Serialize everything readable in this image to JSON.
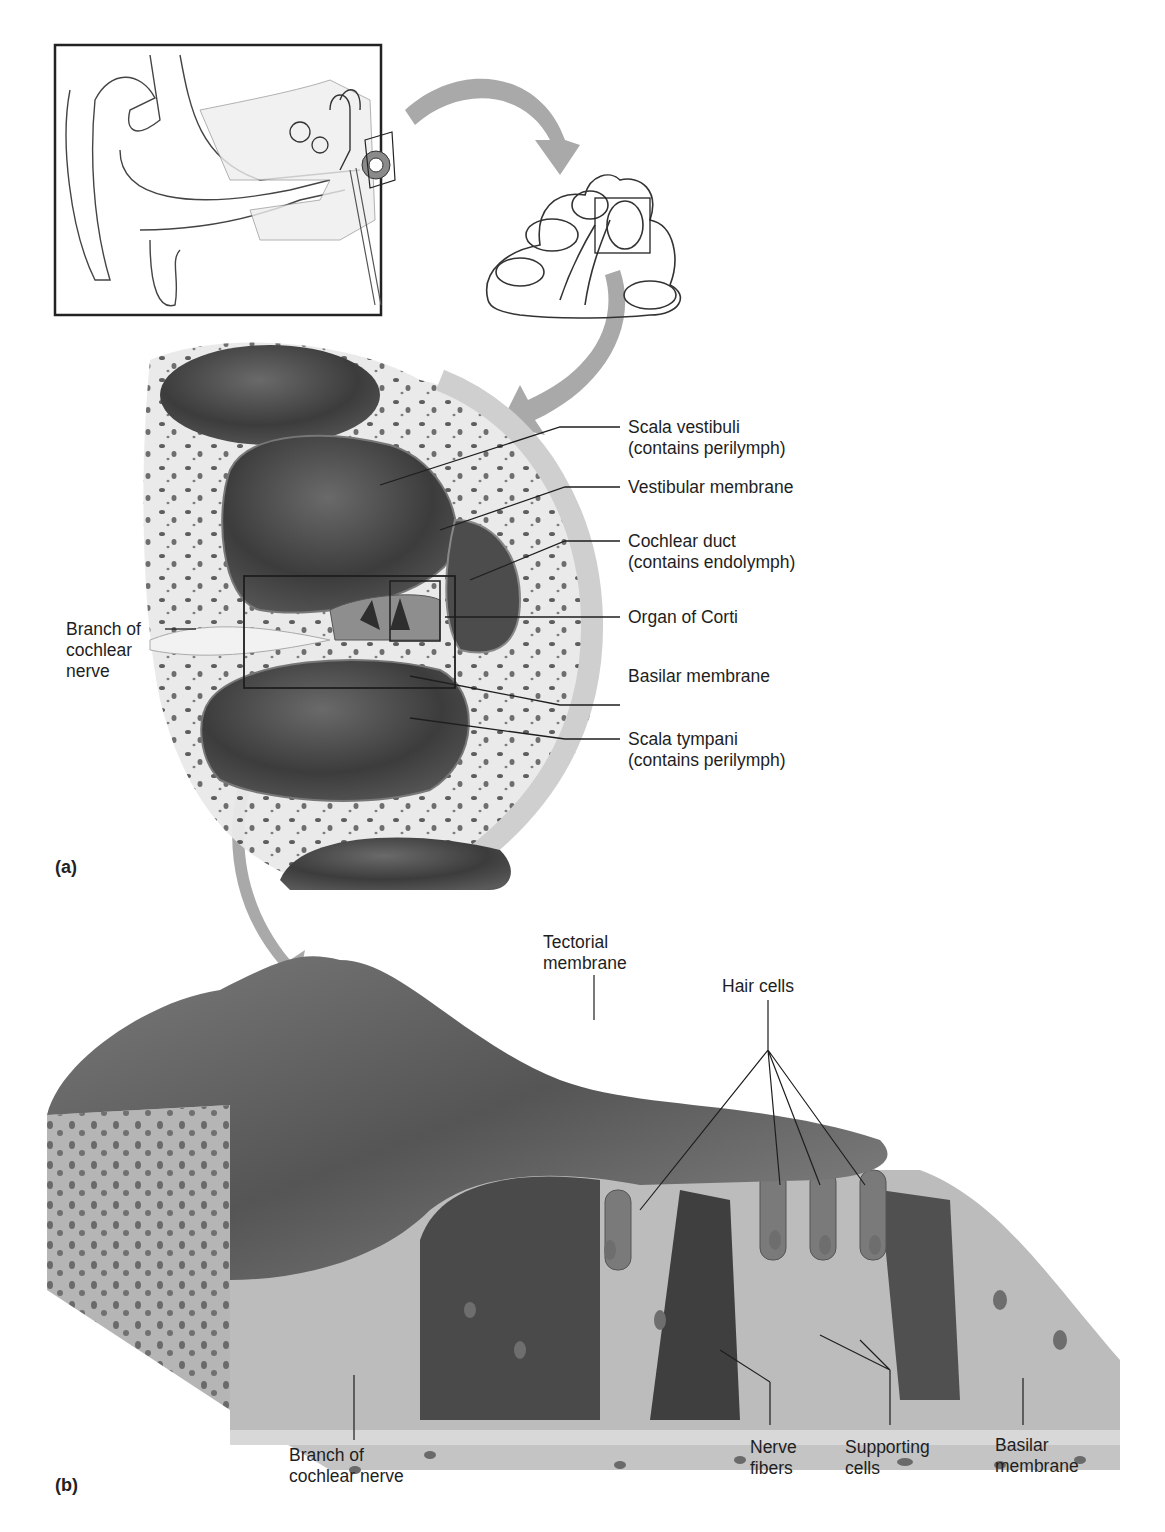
{
  "figure": {
    "panel_a_label": "(a)",
    "panel_b_label": "(b)",
    "inset": {
      "description": "ear-overview-with-cochlea-highlighted"
    },
    "cochlea_section": {
      "description": "cross-section-of-cochlea-turns"
    }
  },
  "labels_a": {
    "scala_vestibuli": {
      "line1": "Scala vestibuli",
      "line2": "(contains perilymph)"
    },
    "vestibular_membrane": {
      "line1": "Vestibular membrane"
    },
    "cochlear_duct": {
      "line1": "Cochlear duct",
      "line2": "(contains endolymph)"
    },
    "organ_of_corti": {
      "line1": "Organ of Corti"
    },
    "basilar_membrane": {
      "line1": "Basilar membrane"
    },
    "scala_tympani": {
      "line1": "Scala tympani",
      "line2": "(contains perilymph)"
    },
    "branch_cochlear_nerve": {
      "line1": "Branch of",
      "line2": "cochlear",
      "line3": "nerve"
    }
  },
  "labels_b": {
    "tectorial_membrane": {
      "line1": "Tectorial",
      "line2": "membrane"
    },
    "hair_cells": {
      "line1": "Hair cells"
    },
    "branch_cochlear_nerve": {
      "line1": "Branch of",
      "line2": "cochlear nerve"
    },
    "nerve_fibers": {
      "line1": "Nerve",
      "line2": "fibers"
    },
    "supporting_cells": {
      "line1": "Supporting",
      "line2": "cells"
    },
    "basilar_membrane": {
      "line1": "Basilar",
      "line2": "membrane"
    }
  },
  "colors": {
    "arrow": "#a9a9a9",
    "fluid_dark": "#3a3a3a",
    "bone": "#e6e6e6",
    "tissue": "#b8b8b8",
    "cell_nucleus": "#6e6e6e",
    "tectorial": "#5e5e5e"
  }
}
